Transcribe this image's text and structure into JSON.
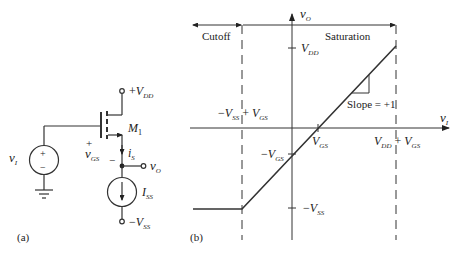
{
  "circuit": {
    "panel_label": "(a)",
    "supply_top": {
      "sign": "+",
      "symbol": "V",
      "sub": "DD"
    },
    "supply_bottom": {
      "sign": "−",
      "symbol": "V",
      "sub": "SS"
    },
    "transistor": {
      "symbol": "M",
      "sub": "1"
    },
    "input_source": {
      "symbol": "v",
      "sub": "I",
      "plus": "+",
      "minus": "−"
    },
    "vgs": {
      "symbol": "v",
      "sub": "GS",
      "plus": "+",
      "minus": "−"
    },
    "source_current": {
      "symbol": "i",
      "sub": "S"
    },
    "output": {
      "symbol": "v",
      "sub": "O"
    },
    "current_source": {
      "symbol": "I",
      "sub": "SS"
    }
  },
  "graph": {
    "panel_label": "(b)",
    "x_axis": {
      "symbol": "v",
      "sub": "I"
    },
    "y_axis": {
      "symbol": "v",
      "sub": "O"
    },
    "regions": {
      "left": "Cutoff",
      "right": "Saturation"
    },
    "ticks": {
      "y_vdd": {
        "symbol": "V",
        "sub": "DD"
      },
      "y_neg_vgs": {
        "prefix": "−",
        "symbol": "V",
        "sub": "GS"
      },
      "y_neg_vss": {
        "prefix": "−",
        "symbol": "V",
        "sub": "SS"
      },
      "x_vgs": {
        "symbol": "V",
        "sub": "GS"
      },
      "x_left_boundary": {
        "a_prefix": "−",
        "a_symbol": "V",
        "a_sub": "SS",
        "op": " + ",
        "b_symbol": "V",
        "b_sub": "GS"
      },
      "x_right_boundary": {
        "a_symbol": "V",
        "a_sub": "DD",
        "op": " + ",
        "b_symbol": "V",
        "b_sub": "GS"
      }
    },
    "slope_annotation": "Slope = +1"
  }
}
